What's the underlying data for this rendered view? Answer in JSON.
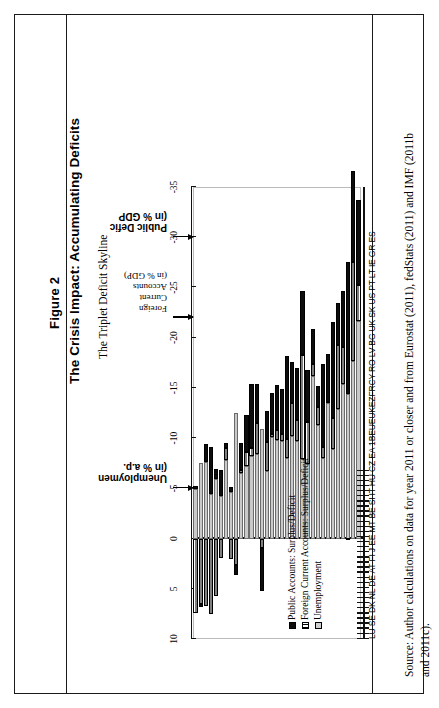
{
  "figure": {
    "number": "Figure 2",
    "title": "The Crisis Impact: Accumulating Deficits",
    "subtitle": "The Triplet Deficit Skyline"
  },
  "source": {
    "line1": "Source: Author calculations on data for year 2011 or closer and from Eurostat (2011), fedStats (2011) and IMF (2011b",
    "line2": "and 2011c)."
  },
  "legend": {
    "position": "inside-bottom-left",
    "items": [
      {
        "label": "Public Accounts: Surplus/Deficit",
        "swatch": "black-solid",
        "color": "#0d0d0d"
      },
      {
        "label": "Foreign Current Accounts: Surplus/Deficit",
        "swatch": "white-hatched",
        "color": "#ffffff"
      },
      {
        "label": "Unemployment",
        "swatch": "light-grey",
        "color": "#cfcfcf"
      }
    ]
  },
  "annotations": [
    {
      "name": "unemployment-callout",
      "lines": [
        "Unemploymen",
        "(in %  a.p."
      ],
      "value_at": -5
    },
    {
      "name": "foreign-current-accounts-callout",
      "lines": [
        "Foreign",
        "Current",
        "Accounts",
        "(in % GDP)"
      ],
      "value_at": -22
    },
    {
      "name": "public-deficit-callout",
      "lines": [
        "Public   Defic",
        "(in  %   GDP"
      ],
      "value_at": -30
    }
  ],
  "chart_data": {
    "type": "bar",
    "subtype": "stacked-horizontal",
    "title": "The Triplet Deficit Skyline",
    "xlabel": "",
    "ylabel": "",
    "grid": false,
    "axis_orientation": "value-axis-top, category-axis-bottom",
    "value_axis": {
      "ticks": [
        10,
        5,
        0,
        -5,
        -10,
        -15,
        -20,
        -25,
        -30,
        -35
      ],
      "tick_labels": [
        "10",
        "5",
        "0",
        "-5",
        "-10",
        "-15",
        "-20",
        "-25",
        "-30",
        "-35"
      ],
      "range": [
        10,
        -35
      ]
    },
    "category_axis": {
      "label_string": "LU SE DK NL DE AT FI  J  EE MT BE SI IT HU CZ EA 1BEUEUKEZFRCY RO LV BG UK SK US PT LT IE GR ES"
    },
    "categories": [
      "LU",
      "SE",
      "DK",
      "NL",
      "DE",
      "AT",
      "FI",
      "J",
      "EE",
      "MT",
      "BE",
      "SI",
      "IT",
      "HU",
      "CZ",
      "EA",
      "1BE",
      "UE",
      "UK",
      "EZ",
      "FR",
      "CY",
      "RO",
      "LV",
      "BG",
      "UK",
      "SK",
      "US",
      "PT",
      "LT",
      "IE",
      "GR",
      "ES"
    ],
    "series": [
      {
        "name": "Unemployment",
        "color": "#cfcfcf",
        "values": [
          -4.9,
          -7.5,
          -7.6,
          -4.4,
          -5.9,
          -4.2,
          -7.8,
          -4.6,
          -12.5,
          -6.5,
          -7.2,
          -8.2,
          -8.4,
          -10.9,
          -6.7,
          -10.1,
          -9.8,
          -9.7,
          -8.0,
          -10.2,
          -9.7,
          -7.9,
          -7.4,
          -16.2,
          -11.3,
          -8.0,
          -13.5,
          -8.9,
          -12.9,
          -15.4,
          -14.4,
          -17.7,
          -21.7
        ]
      },
      {
        "name": "Foreign Current Accounts: Surplus/Deficit",
        "color": "#ffffff",
        "values": [
          7.4,
          6.5,
          6.7,
          7.5,
          5.7,
          1.9,
          -1.2,
          2.0,
          2.6,
          -0.3,
          -1.4,
          -0.8,
          -3.1,
          0.9,
          -2.9,
          -0.3,
          -1.0,
          -0.7,
          -1.9,
          -3.3,
          -2.1,
          -10.4,
          -4.2,
          -1.2,
          -1.8,
          -1.1,
          -0.1,
          -3.1,
          -6.4,
          -3.7,
          0.1,
          -9.8,
          -3.5
        ]
      },
      {
        "name": "Public Accounts: Surplus/Deficit",
        "color": "#0d0d0d",
        "values": [
          -0.3,
          0.3,
          -1.8,
          -4.7,
          -1.0,
          -2.6,
          -0.5,
          -0.5,
          1.0,
          -2.7,
          -3.7,
          -6.4,
          -3.9,
          4.3,
          -3.1,
          -4.1,
          -4.5,
          -4.5,
          -8.3,
          -4.1,
          -5.2,
          -6.3,
          -5.2,
          -3.5,
          -2.1,
          -8.3,
          -4.8,
          -9.6,
          -4.2,
          -5.5,
          -13.1,
          -9.1,
          -8.5
        ]
      }
    ]
  }
}
